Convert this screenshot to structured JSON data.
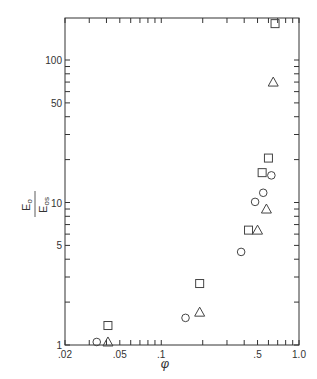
{
  "chart_data": {
    "type": "scatter",
    "title": "",
    "xlabel": "φ",
    "ylabel": "E_o / E_os",
    "ylabel_num": "E",
    "ylabel_num_sub": "o",
    "ylabel_den": "E",
    "ylabel_den_sub": "os",
    "xscale": "log",
    "yscale": "log",
    "xlim": [
      0.02,
      1.0
    ],
    "ylim": [
      1,
      200
    ],
    "grid": false,
    "legend": null,
    "x_ticks": [
      {
        "value": 0.02,
        "label": ".02"
      },
      {
        "value": 0.05,
        "label": ".05"
      },
      {
        "value": 0.1,
        "label": ".1"
      },
      {
        "value": 0.5,
        "label": ".5"
      },
      {
        "value": 1.0,
        "label": "1.0"
      }
    ],
    "y_ticks": [
      {
        "value": 1,
        "label": "1"
      },
      {
        "value": 5,
        "label": "5"
      },
      {
        "value": 10,
        "label": "10"
      },
      {
        "value": 50,
        "label": "50"
      },
      {
        "value": 100,
        "label": "100"
      }
    ],
    "series": [
      {
        "name": "square",
        "marker": "square",
        "points": [
          [
            0.041,
            1.37
          ],
          [
            0.19,
            2.7
          ],
          [
            0.43,
            6.4
          ],
          [
            0.54,
            16.2
          ],
          [
            0.6,
            20.5
          ],
          [
            0.67,
            180
          ]
        ]
      },
      {
        "name": "circle",
        "marker": "circle",
        "points": [
          [
            0.034,
            1.05
          ],
          [
            0.15,
            1.55
          ],
          [
            0.38,
            4.5
          ],
          [
            0.48,
            10.1
          ],
          [
            0.55,
            11.7
          ],
          [
            0.63,
            15.5
          ]
        ]
      },
      {
        "name": "triangle",
        "marker": "triangle",
        "points": [
          [
            0.041,
            1.05
          ],
          [
            0.19,
            1.7
          ],
          [
            0.5,
            6.4
          ],
          [
            0.58,
            9.0
          ],
          [
            0.65,
            70
          ]
        ]
      }
    ]
  }
}
